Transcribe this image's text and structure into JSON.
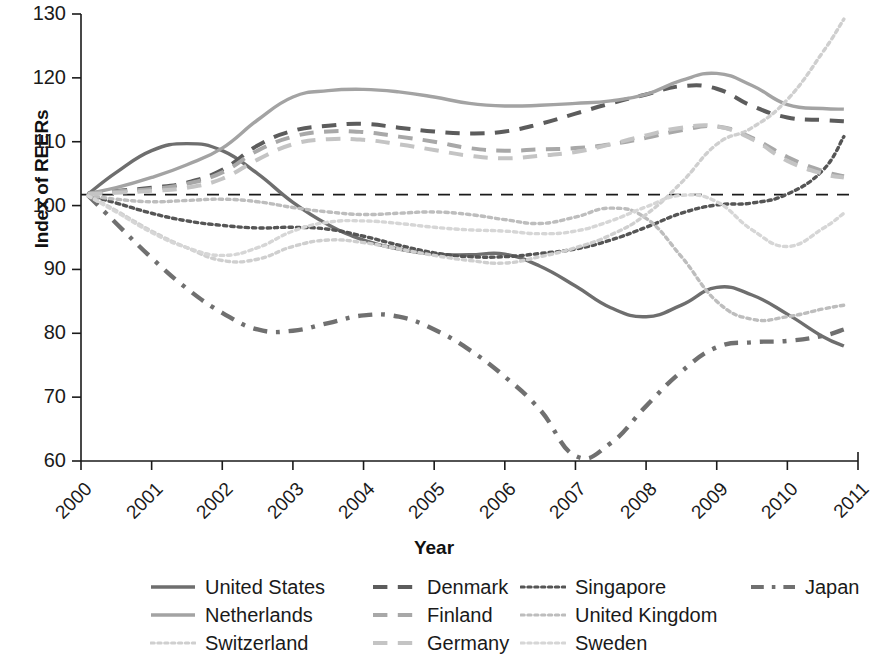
{
  "chart_data": {
    "type": "line",
    "title": "",
    "xlabel": "Year",
    "ylabel": "Index of REERs",
    "xlim": [
      2000,
      2011
    ],
    "ylim": [
      60,
      130
    ],
    "xticks": [
      "2000",
      "2001",
      "2002",
      "2003",
      "2004",
      "2005",
      "2006",
      "2007",
      "2008",
      "2009",
      "2010",
      "2011"
    ],
    "yticks": [
      "130",
      "120",
      "110",
      "100",
      "90",
      "80",
      "70",
      "60"
    ],
    "grid": false,
    "legend_position": "bottom",
    "reference_line": {
      "value": 101.7,
      "style": "dashed",
      "color": "#1a1a1a"
    },
    "x": [
      2000.1,
      2000.5,
      2001.0,
      2001.5,
      2002.0,
      2002.5,
      2003.0,
      2003.5,
      2004.0,
      2004.5,
      2005.0,
      2005.5,
      2006.0,
      2006.5,
      2007.0,
      2007.5,
      2008.0,
      2008.5,
      2009.0,
      2009.5,
      2010.0,
      2010.5,
      2010.8
    ],
    "series": [
      {
        "name": "United States",
        "style": "solid",
        "color": "#6e6e6e",
        "values": [
          101.8,
          105.2,
          108.6,
          109.7,
          108.6,
          105.0,
          100.5,
          97.0,
          94.6,
          93.2,
          92.4,
          92.3,
          92.4,
          90.5,
          87.4,
          84.0,
          82.6,
          84.4,
          87.2,
          86.0,
          83.0,
          79.5,
          78.0
        ]
      },
      {
        "name": "Denmark",
        "style": "dashed",
        "color": "#5c5c5c",
        "values": [
          101.9,
          102.3,
          102.8,
          103.6,
          105.6,
          109.4,
          111.7,
          112.5,
          112.8,
          112.2,
          111.6,
          111.3,
          111.6,
          112.8,
          114.4,
          116.0,
          117.4,
          118.7,
          118.3,
          115.6,
          113.8,
          113.4,
          113.2
        ]
      },
      {
        "name": "Singapore",
        "style": "dotted",
        "color": "#555555",
        "values": [
          101.6,
          100.4,
          98.8,
          97.6,
          96.9,
          96.5,
          96.6,
          96.3,
          95.2,
          93.8,
          92.6,
          92.0,
          92.0,
          92.5,
          93.2,
          94.6,
          96.6,
          98.8,
          100.1,
          100.4,
          101.8,
          105.5,
          110.8
        ]
      },
      {
        "name": "Japan",
        "style": "dashdot",
        "color": "#707070",
        "values": [
          101.6,
          97.2,
          91.8,
          87.0,
          83.2,
          80.6,
          80.4,
          81.6,
          82.8,
          82.6,
          80.6,
          77.4,
          73.2,
          68.0,
          60.8,
          62.8,
          68.6,
          74.0,
          77.8,
          78.6,
          78.8,
          79.6,
          80.6
        ]
      },
      {
        "name": "Netherlands",
        "style": "solid",
        "color": "#a3a3a3",
        "values": [
          101.9,
          102.8,
          104.4,
          106.4,
          109.0,
          113.4,
          117.0,
          118.0,
          118.2,
          117.8,
          117.0,
          116.0,
          115.6,
          115.7,
          116.0,
          116.4,
          117.4,
          119.6,
          120.7,
          118.8,
          115.8,
          115.2,
          115.1
        ]
      },
      {
        "name": "Finland",
        "style": "dashed",
        "color": "#a8a8a8",
        "values": [
          101.9,
          102.2,
          102.6,
          103.4,
          105.2,
          108.6,
          110.8,
          111.6,
          111.5,
          110.8,
          110.0,
          109.0,
          108.6,
          108.8,
          109.0,
          109.6,
          110.6,
          111.8,
          112.4,
          110.6,
          107.6,
          105.4,
          104.6
        ]
      },
      {
        "name": "United Kingdom",
        "style": "dotted",
        "color": "#bdbdbd",
        "values": [
          101.6,
          101.0,
          100.6,
          100.8,
          101.0,
          100.6,
          99.7,
          99.0,
          98.6,
          98.8,
          99.0,
          98.6,
          97.8,
          97.2,
          98.2,
          99.6,
          98.0,
          92.0,
          85.0,
          82.2,
          82.6,
          83.8,
          84.4
        ]
      },
      {
        "name": "Switzerland",
        "style": "dotted",
        "color": "#cfcfcf",
        "values": [
          101.6,
          99.2,
          96.0,
          93.4,
          91.4,
          91.6,
          93.6,
          94.6,
          94.2,
          93.2,
          92.2,
          91.4,
          91.0,
          92.0,
          93.4,
          95.4,
          98.6,
          103.6,
          109.6,
          112.2,
          116.6,
          124.0,
          129.2
        ]
      },
      {
        "name": "Germany",
        "style": "dashed",
        "color": "#c4c4c4",
        "values": [
          101.8,
          102.0,
          102.3,
          102.8,
          104.2,
          107.2,
          109.6,
          110.4,
          110.3,
          109.6,
          108.7,
          107.8,
          107.4,
          107.8,
          108.4,
          109.6,
          111.0,
          112.2,
          112.4,
          110.4,
          107.0,
          105.0,
          104.4
        ]
      },
      {
        "name": "Sweden",
        "style": "dotted",
        "color": "#d6d6d6",
        "values": [
          101.5,
          99.0,
          95.8,
          93.4,
          92.2,
          93.4,
          96.0,
          97.4,
          97.6,
          97.2,
          96.6,
          96.2,
          96.0,
          95.6,
          96.0,
          97.6,
          99.8,
          101.6,
          100.6,
          96.2,
          93.6,
          96.4,
          98.8
        ]
      }
    ]
  },
  "axis": {
    "ylabel": "Index of REERs",
    "xlabel": "Year"
  },
  "legend": {
    "rows": [
      [
        {
          "label": "United States",
          "style": "solid",
          "color": "#6e6e6e"
        },
        {
          "label": "Denmark",
          "style": "dashed",
          "color": "#5c5c5c"
        },
        {
          "label": "Singapore",
          "style": "dotted",
          "color": "#555555"
        },
        {
          "label": "Japan",
          "style": "dashdot",
          "color": "#707070"
        }
      ],
      [
        {
          "label": "Netherlands",
          "style": "solid",
          "color": "#a3a3a3"
        },
        {
          "label": "Finland",
          "style": "dashed",
          "color": "#a8a8a8"
        },
        {
          "label": "United Kingdom",
          "style": "dotted",
          "color": "#bdbdbd"
        }
      ],
      [
        {
          "label": "Switzerland",
          "style": "dotted",
          "color": "#cfcfcf"
        },
        {
          "label": "Germany",
          "style": "dashed",
          "color": "#c4c4c4"
        },
        {
          "label": "Sweden",
          "style": "dotted",
          "color": "#d6d6d6"
        }
      ]
    ],
    "column_offsets": [
      0,
      222,
      370,
      600
    ]
  }
}
